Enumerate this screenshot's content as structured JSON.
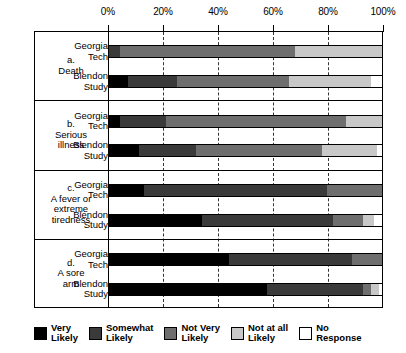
{
  "chart_data": {
    "type": "bar",
    "orientation": "horizontal",
    "style": "stacked-percent",
    "title": "",
    "xlabel": "",
    "ylabel": "",
    "xlim": [
      0,
      100
    ],
    "xticks": [
      0,
      20,
      40,
      60,
      80,
      100
    ],
    "xtick_labels": [
      "0%",
      "20%",
      "40%",
      "60%",
      "80%",
      "100%"
    ],
    "grid": "vertical-dashed",
    "legend_position": "bottom",
    "series": [
      {
        "name": "Very Likely",
        "color": "#000000"
      },
      {
        "name": "Somewhat Likely",
        "color": "#3a3a3a"
      },
      {
        "name": "Not Very Likely",
        "color": "#6e6e6e"
      },
      {
        "name": "Not at all Likely",
        "color": "#c8c8c8"
      },
      {
        "name": "No Response",
        "color": "#ffffff"
      }
    ],
    "groups": [
      {
        "key": "a",
        "label_lines": [
          "a.",
          "Death"
        ],
        "bars": [
          {
            "label_lines": [
              "Georgia",
              "Tech"
            ],
            "values": [
              0,
              4,
              64,
              32,
              0
            ]
          },
          {
            "label_lines": [
              "Blendon",
              "Study"
            ],
            "values": [
              7,
              18,
              41,
              30,
              4
            ]
          }
        ]
      },
      {
        "key": "b",
        "label_lines": [
          "b.",
          "Serious",
          "illness"
        ],
        "bars": [
          {
            "label_lines": [
              "Georgia",
              "Tech"
            ],
            "values": [
              4,
              17,
              66,
              13,
              0
            ]
          },
          {
            "label_lines": [
              "Blendon",
              "Study"
            ],
            "values": [
              11,
              21,
              46,
              20,
              2
            ]
          }
        ]
      },
      {
        "key": "c",
        "label_lines": [
          "c.",
          "A fever or",
          "extreme",
          "tiredness"
        ],
        "bars": [
          {
            "label_lines": [
              "Georgia",
              "Tech"
            ],
            "values": [
              13,
              67,
              20,
              0,
              0
            ]
          },
          {
            "label_lines": [
              "Blendon",
              "Study"
            ],
            "values": [
              34,
              48,
              11,
              4,
              3
            ]
          }
        ]
      },
      {
        "key": "d",
        "label_lines": [
          "d.",
          "A sore",
          "arm"
        ],
        "bars": [
          {
            "label_lines": [
              "Georgia",
              "Tech"
            ],
            "values": [
              44,
              45,
              11,
              0,
              0
            ]
          },
          {
            "label_lines": [
              "Blendon",
              "Study"
            ],
            "values": [
              58,
              35,
              3,
              3,
              1
            ]
          }
        ]
      }
    ]
  },
  "legend": {
    "items": [
      {
        "label_lines": [
          "Very",
          "Likely"
        ],
        "color": "#000000"
      },
      {
        "label_lines": [
          "Somewhat",
          "Likely"
        ],
        "color": "#3a3a3a"
      },
      {
        "label_lines": [
          "Not Very",
          "Likely"
        ],
        "color": "#6e6e6e"
      },
      {
        "label_lines": [
          "Not at all",
          "Likely"
        ],
        "color": "#c8c8c8"
      },
      {
        "label_lines": [
          "No",
          "Response"
        ],
        "color": "#ffffff"
      }
    ]
  }
}
